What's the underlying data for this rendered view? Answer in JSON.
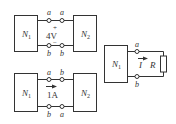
{
  "diagram": {
    "circuit_top": {
      "box_left": {
        "label": "N",
        "sub": "1"
      },
      "box_right": {
        "label": "N",
        "sub": "2"
      },
      "terminal_top_left": "a",
      "terminal_top_right": "a",
      "terminal_bottom_left": "b",
      "terminal_bottom_right": "b",
      "plus": "+",
      "minus": "−",
      "value": "4V"
    },
    "circuit_bottom": {
      "box_left": {
        "label": "N",
        "sub": "1"
      },
      "box_right": {
        "label": "N",
        "sub": "2"
      },
      "terminal_top_left": "a",
      "terminal_top_right": "b",
      "terminal_bottom_left": "b",
      "terminal_bottom_right": "a",
      "value": "1A"
    },
    "circuit_right": {
      "box": {
        "label": "N",
        "sub": "1"
      },
      "terminal_top": "a",
      "terminal_bottom": "b",
      "current": "I",
      "resistor": "R"
    },
    "colors": {
      "stroke": "#333333",
      "background": "#ffffff"
    }
  }
}
